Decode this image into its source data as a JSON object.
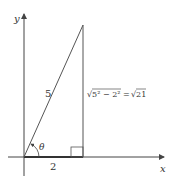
{
  "diagram": {
    "axes": {
      "x_label": "x",
      "y_label": "y"
    },
    "triangle": {
      "hypotenuse_label": "5",
      "base_label": "2",
      "vertical_label_left": "√5² − 2²",
      "vertical_label_eq": "=",
      "vertical_label_right": "√21",
      "angle_label": "θ",
      "right_angle_marker": true
    },
    "colors": {
      "line": "#555555",
      "axis": "#444444",
      "background": "#ffffff"
    }
  }
}
